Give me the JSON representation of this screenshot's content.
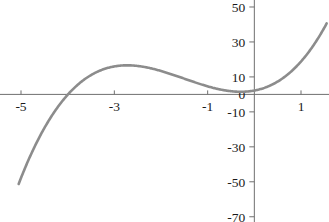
{
  "chart_data": {
    "type": "line",
    "title": "",
    "subtitle": "",
    "xlabel": "",
    "ylabel": "",
    "xlim": [
      -5.45,
      1.6
    ],
    "ylim": [
      -73,
      54
    ],
    "grid": false,
    "legend": null,
    "x_ticks": [
      -5,
      -3,
      -1,
      1
    ],
    "x_tick_labels": [
      "-5",
      "-3",
      "-1",
      "1"
    ],
    "y_ticks": [
      50,
      30,
      10,
      0,
      -10,
      -30,
      -50,
      -70
    ],
    "y_tick_labels": [
      "50",
      "30",
      "10",
      "0",
      "-10",
      "-30",
      "-50",
      "-70"
    ],
    "curve_color": "#8c8c8c",
    "axis_color": "#6f6f6f",
    "series": [
      {
        "name": "cubic",
        "equation": "y = 2.1x^3 + 9.5x^2 + 5x + 2.2",
        "coefficients": {
          "a": 2.1,
          "b": 9.5,
          "c": 5,
          "d": 2.2
        },
        "x_domain": [
          -5.05,
          1.55
        ],
        "features": {
          "local_max": {
            "x": -2.6,
            "y": 13
          },
          "local_min": {
            "x": -0.15,
            "y": 2
          },
          "x_intercept": -3.62
        },
        "points": [
          {
            "x": -5.05,
            "y": -72
          },
          {
            "x": -4.8,
            "y": -53
          },
          {
            "x": -4.5,
            "y": -33
          },
          {
            "x": -4.2,
            "y": -15
          },
          {
            "x": -3.9,
            "y": -1
          },
          {
            "x": -3.62,
            "y": 0
          },
          {
            "x": -3.6,
            "y": 7
          },
          {
            "x": -3.3,
            "y": 13
          },
          {
            "x": -3.0,
            "y": 16
          },
          {
            "x": -2.6,
            "y": 13
          },
          {
            "x": -2.2,
            "y": 13
          },
          {
            "x": -1.8,
            "y": 11
          },
          {
            "x": -1.4,
            "y": 8
          },
          {
            "x": -1.0,
            "y": 5
          },
          {
            "x": -0.6,
            "y": 2
          },
          {
            "x": -0.15,
            "y": 2
          },
          {
            "x": 0,
            "y": 2
          },
          {
            "x": 0.3,
            "y": 4
          },
          {
            "x": 0.6,
            "y": 9
          },
          {
            "x": 0.9,
            "y": 16
          },
          {
            "x": 1.2,
            "y": 30
          },
          {
            "x": 1.45,
            "y": 45
          },
          {
            "x": 1.55,
            "y": 53
          }
        ]
      }
    ]
  },
  "cropped_header": {
    "text": "· · · · · · · · · · · · · · · ·"
  }
}
